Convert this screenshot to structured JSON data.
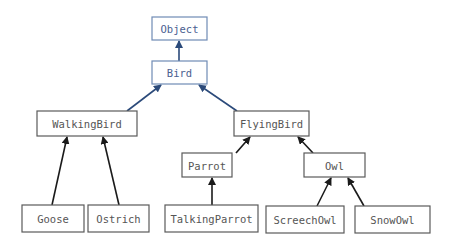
{
  "diagram": {
    "type": "class-hierarchy",
    "colors": {
      "top_box_border": "#6f8bb5",
      "top_label": "#4a6090",
      "box_border": "#5a5a5a",
      "label": "#555555",
      "arrow_blue": "#2b4a7a",
      "arrow_black": "#1a1a1a"
    },
    "nodes": [
      {
        "id": "object",
        "label": "Object",
        "x": 152,
        "y": 17,
        "w": 55,
        "h": 23,
        "style": "top"
      },
      {
        "id": "bird",
        "label": "Bird",
        "x": 152,
        "y": 61,
        "w": 55,
        "h": 23,
        "style": "top"
      },
      {
        "id": "walkingbird",
        "label": "WalkingBird",
        "x": 37,
        "y": 111,
        "w": 100,
        "h": 25,
        "style": "normal"
      },
      {
        "id": "flyingbird",
        "label": "FlyingBird",
        "x": 234,
        "y": 111,
        "w": 75,
        "h": 25,
        "style": "normal"
      },
      {
        "id": "parrot",
        "label": "Parrot",
        "x": 182,
        "y": 153,
        "w": 50,
        "h": 24,
        "style": "normal"
      },
      {
        "id": "owl",
        "label": "Owl",
        "x": 304,
        "y": 153,
        "w": 61,
        "h": 24,
        "style": "normal"
      },
      {
        "id": "goose",
        "label": "Goose",
        "x": 22,
        "y": 205,
        "w": 62,
        "h": 27,
        "style": "normal"
      },
      {
        "id": "ostrich",
        "label": "Ostrich",
        "x": 88,
        "y": 205,
        "w": 61,
        "h": 27,
        "style": "normal"
      },
      {
        "id": "talkingparrot",
        "label": "TalkingParrot",
        "x": 165,
        "y": 205,
        "w": 93,
        "h": 27,
        "style": "normal"
      },
      {
        "id": "screechowl",
        "label": "ScreechOwl",
        "x": 266,
        "y": 206,
        "w": 78,
        "h": 27,
        "style": "normal"
      },
      {
        "id": "snowowl",
        "label": "SnowOwl",
        "x": 355,
        "y": 206,
        "w": 75,
        "h": 27,
        "style": "normal"
      }
    ],
    "edges": [
      {
        "from": "bird",
        "to": "object",
        "x1": 179,
        "y1": 61,
        "x2": 179,
        "y2": 41,
        "color": "blue"
      },
      {
        "from": "walkingbird",
        "to": "bird",
        "x1": 127,
        "y1": 111,
        "x2": 161,
        "y2": 85,
        "color": "blue"
      },
      {
        "from": "flyingbird",
        "to": "bird",
        "x1": 237,
        "y1": 111,
        "x2": 199,
        "y2": 85,
        "color": "blue"
      },
      {
        "from": "goose",
        "to": "walkingbird",
        "x1": 52,
        "y1": 205,
        "x2": 67,
        "y2": 137,
        "color": "black"
      },
      {
        "from": "ostrich",
        "to": "walkingbird",
        "x1": 119,
        "y1": 205,
        "x2": 103,
        "y2": 137,
        "color": "black"
      },
      {
        "from": "parrot",
        "to": "flyingbird",
        "x1": 236,
        "y1": 153,
        "x2": 250,
        "y2": 137,
        "color": "black"
      },
      {
        "from": "owl",
        "to": "flyingbird",
        "x1": 313,
        "y1": 153,
        "x2": 298,
        "y2": 137,
        "color": "black"
      },
      {
        "from": "talkingparrot",
        "to": "parrot",
        "x1": 212,
        "y1": 205,
        "x2": 212,
        "y2": 178,
        "color": "black"
      },
      {
        "from": "screechowl",
        "to": "owl",
        "x1": 317,
        "y1": 206,
        "x2": 331,
        "y2": 178,
        "color": "black"
      },
      {
        "from": "snowowl",
        "to": "owl",
        "x1": 364,
        "y1": 206,
        "x2": 348,
        "y2": 178,
        "color": "black"
      }
    ]
  }
}
